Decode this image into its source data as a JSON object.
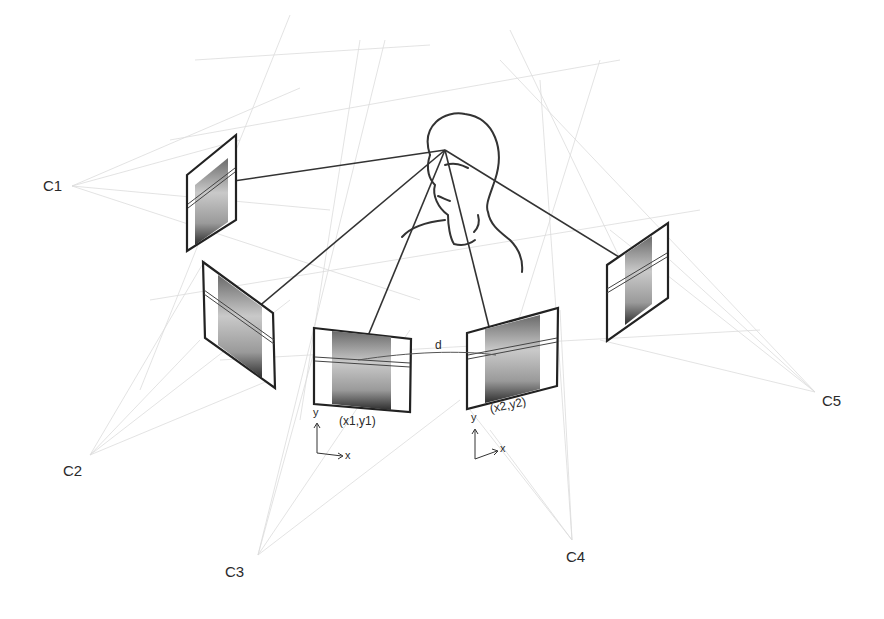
{
  "diagram": {
    "cameras": [
      {
        "id": "C1",
        "label": "C1",
        "x": 65,
        "y": 186
      },
      {
        "id": "C2",
        "label": "C2",
        "x": 85,
        "y": 463
      },
      {
        "id": "C3",
        "label": "C3",
        "x": 252,
        "y": 560
      },
      {
        "id": "C4",
        "label": "C4",
        "x": 566,
        "y": 545
      },
      {
        "id": "C5",
        "label": "C5",
        "x": 822,
        "y": 400
      }
    ],
    "image_planes": [
      {
        "camera": "C1",
        "label": ""
      },
      {
        "camera": "C2",
        "label": ""
      },
      {
        "camera": "C3",
        "label": "(x1,y1)"
      },
      {
        "camera": "C4",
        "label": "(x2,y2)"
      },
      {
        "camera": "C5",
        "label": ""
      }
    ],
    "point_labels": {
      "p1": "(x1,y1)",
      "p2": "(x2,y2)"
    },
    "distance_label": "d",
    "axis_labels": {
      "x": "x",
      "y": "y"
    },
    "colors": {
      "ray": "#333333",
      "frustum": "#d8d8d8",
      "frame": "#222222",
      "photo_bg": "#cfcfcf",
      "photo_dark": "#3a3a3a",
      "text": "#2a2a2a"
    }
  }
}
